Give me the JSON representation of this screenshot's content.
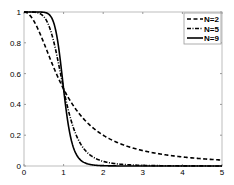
{
  "chart_data": {
    "type": "line",
    "title": "",
    "xlabel": "",
    "ylabel": "",
    "xlim": [
      0,
      5
    ],
    "ylim": [
      0,
      1
    ],
    "grid": false,
    "legend_position": "upper right",
    "xticks": [
      "0",
      "1",
      "2",
      "3",
      "4",
      "5"
    ],
    "yticks": [
      "0",
      "0.2",
      "0.4",
      "0.6",
      "0.8",
      "1"
    ],
    "x": [
      0,
      0.25,
      0.5,
      0.75,
      0.9,
      1.0,
      1.1,
      1.25,
      1.5,
      1.75,
      2.0,
      2.5,
      3.0,
      3.5,
      4.0,
      4.5,
      5.0
    ],
    "series": [
      {
        "name": "N=2",
        "style": "dashed",
        "values": [
          1.0,
          0.94,
          0.8,
          0.64,
          0.55,
          0.5,
          0.45,
          0.39,
          0.31,
          0.25,
          0.2,
          0.14,
          0.1,
          0.075,
          0.059,
          0.047,
          0.038
        ]
      },
      {
        "name": "N=5",
        "style": "dash-dot",
        "values": [
          1.0,
          1.0,
          0.97,
          0.81,
          0.63,
          0.5,
          0.38,
          0.25,
          0.12,
          0.06,
          0.03,
          0.01,
          0.004,
          0.002,
          0.001,
          0.0005,
          0.0003
        ]
      },
      {
        "name": "N=9",
        "style": "solid",
        "values": [
          1.0,
          1.0,
          1.0,
          0.93,
          0.72,
          0.5,
          0.3,
          0.12,
          0.026,
          0.006,
          0.002,
          0.0003,
          0.0001,
          0.0,
          0.0,
          0.0,
          0.0
        ]
      }
    ]
  }
}
